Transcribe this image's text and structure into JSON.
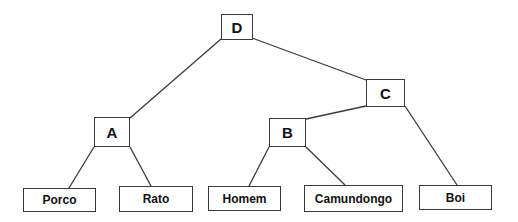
{
  "diagram": {
    "type": "tree",
    "nodes": {
      "D": {
        "label": "D",
        "x": 221,
        "y": 14,
        "w": 32,
        "h": 26
      },
      "C": {
        "label": "C",
        "x": 366,
        "y": 79,
        "w": 39,
        "h": 28
      },
      "A": {
        "label": "A",
        "x": 94,
        "y": 117,
        "w": 36,
        "h": 30
      },
      "B": {
        "label": "B",
        "x": 269,
        "y": 118,
        "w": 37,
        "h": 29
      },
      "porco": {
        "label": "Porco",
        "x": 23,
        "y": 188,
        "w": 73,
        "h": 24
      },
      "rato": {
        "label": "Rato",
        "x": 119,
        "y": 186,
        "w": 74,
        "h": 26
      },
      "homem": {
        "label": "Homem",
        "x": 208,
        "y": 186,
        "w": 73,
        "h": 25
      },
      "camundongo": {
        "label": "Camundongo",
        "x": 304,
        "y": 185,
        "w": 99,
        "h": 27
      },
      "boi": {
        "label": "Boi",
        "x": 419,
        "y": 185,
        "w": 73,
        "h": 25
      }
    },
    "edges": [
      {
        "from": "D",
        "to": "A"
      },
      {
        "from": "D",
        "to": "C"
      },
      {
        "from": "A",
        "to": "porco"
      },
      {
        "from": "A",
        "to": "rato"
      },
      {
        "from": "C",
        "to": "B"
      },
      {
        "from": "C",
        "to": "boi"
      },
      {
        "from": "B",
        "to": "homem"
      },
      {
        "from": "B",
        "to": "camundongo"
      }
    ],
    "colors": {
      "stroke": "#3a3a3a",
      "text": "#111111",
      "background": "#ffffff"
    }
  }
}
